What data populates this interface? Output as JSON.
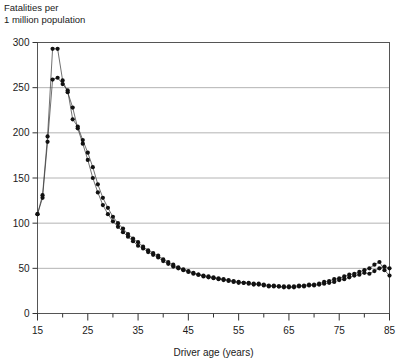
{
  "chart_data": {
    "type": "scatter",
    "title": "",
    "ylabel_lines": [
      "Fatalities per",
      "1 million population"
    ],
    "xlabel": "Driver age (years)",
    "ylabel": "Fatalities per 1 million population",
    "xlim": [
      15,
      85
    ],
    "ylim": [
      0,
      300
    ],
    "yticks": [
      0,
      50,
      100,
      150,
      200,
      250,
      300
    ],
    "ytick_labels": [
      "0",
      "50",
      "100",
      "150",
      "200",
      "250",
      "300"
    ],
    "xticks": [
      15,
      25,
      35,
      45,
      55,
      65,
      75,
      85
    ],
    "xtick_labels": [
      "15",
      "25",
      "35",
      "45",
      "55",
      "65",
      "75",
      "85"
    ],
    "xminor_ticks": [
      20,
      30,
      40,
      50,
      60,
      70,
      80
    ],
    "grid": "horizontal",
    "grid_color": "#b4b4b4",
    "marker": "filled-circle",
    "marker_color": "#111111",
    "line_color": "#333333",
    "legend": "none",
    "x": [
      15,
      16,
      17,
      18,
      19,
      20,
      21,
      22,
      23,
      24,
      25,
      26,
      27,
      28,
      29,
      30,
      31,
      32,
      33,
      34,
      35,
      36,
      37,
      38,
      39,
      40,
      41,
      42,
      43,
      44,
      45,
      46,
      47,
      48,
      49,
      50,
      51,
      52,
      53,
      54,
      55,
      56,
      57,
      58,
      59,
      60,
      61,
      62,
      63,
      64,
      65,
      66,
      67,
      68,
      69,
      70,
      71,
      72,
      73,
      74,
      75,
      76,
      77,
      78,
      79,
      80,
      81,
      82,
      83,
      84,
      85
    ],
    "series": [
      {
        "name": "series-a",
        "values": [
          110,
          131,
          196,
          293,
          293,
          258,
          245,
          228,
          205,
          188,
          170,
          150,
          134,
          120,
          110,
          102,
          96,
          90,
          85,
          80,
          75,
          72,
          68,
          65,
          62,
          58,
          55,
          52,
          50,
          48,
          46,
          44,
          43,
          41,
          40,
          39,
          38,
          37,
          36,
          35,
          34,
          34,
          33,
          32,
          32,
          31,
          30,
          30,
          30,
          29,
          29,
          29,
          30,
          30,
          31,
          31,
          32,
          33,
          34,
          35,
          37,
          38,
          40,
          42,
          43,
          45,
          44,
          47,
          50,
          52,
          50
        ]
      },
      {
        "name": "series-b",
        "values": [
          110,
          128,
          190,
          259,
          261,
          254,
          247,
          215,
          207,
          192,
          178,
          162,
          143,
          128,
          117,
          107,
          100,
          94,
          88,
          83,
          79,
          74,
          70,
          67,
          64,
          60,
          57,
          54,
          51,
          49,
          47,
          45,
          43,
          42,
          41,
          40,
          39,
          38,
          37,
          36,
          35,
          34,
          34,
          33,
          33,
          32,
          31,
          31,
          30,
          30,
          30,
          30,
          31,
          31,
          32,
          32,
          33,
          35,
          36,
          38,
          39,
          41,
          43,
          44,
          46,
          48,
          50,
          54,
          57,
          48,
          42
        ]
      }
    ]
  }
}
